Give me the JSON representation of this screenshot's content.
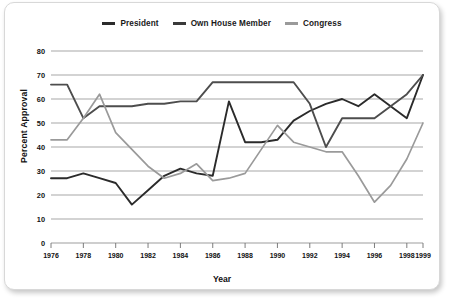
{
  "chart_data": {
    "type": "line",
    "title": "",
    "xlabel": "Year",
    "ylabel": "Percent Approval",
    "xlim": [
      1976,
      1999
    ],
    "ylim": [
      0,
      80
    ],
    "yticks": [
      0,
      10,
      20,
      30,
      40,
      50,
      60,
      70,
      80
    ],
    "xticks": [
      1976,
      1978,
      1980,
      1982,
      1984,
      1986,
      1988,
      1990,
      1992,
      1994,
      1996,
      1998,
      1999
    ],
    "grid": true,
    "legend_position": "top-center",
    "x": [
      1976,
      1977,
      1978,
      1979,
      1980,
      1981,
      1982,
      1983,
      1984,
      1985,
      1986,
      1987,
      1988,
      1989,
      1990,
      1991,
      1992,
      1993,
      1994,
      1995,
      1996,
      1997,
      1998,
      1999
    ],
    "series": [
      {
        "name": "President",
        "color": "#2b2b2b",
        "values": [
          27,
          27,
          29,
          27,
          25,
          16,
          22,
          28,
          31,
          29,
          28,
          59,
          42,
          42,
          43,
          51,
          55,
          58,
          60,
          57,
          62,
          57,
          52,
          70
        ]
      },
      {
        "name": "Own House Member",
        "color": "#4d4d4d",
        "values": [
          66,
          66,
          52,
          57,
          57,
          57,
          58,
          58,
          59,
          59,
          67,
          67,
          67,
          67,
          67,
          67,
          58,
          40,
          52,
          52,
          52,
          57,
          62,
          70
        ]
      },
      {
        "name": "Congress",
        "color": "#9a9a9a",
        "values": [
          43,
          43,
          52,
          62,
          46,
          39,
          32,
          27,
          29,
          33,
          26,
          27,
          29,
          39,
          49,
          42,
          40,
          38,
          38,
          28,
          17,
          24,
          35,
          50
        ]
      }
    ]
  },
  "legend": {
    "items": [
      {
        "label": "President",
        "color": "#2b2b2b",
        "swatch": "line-swatch"
      },
      {
        "label": "Own House Member",
        "color": "#3a3a3a",
        "swatch": "line-swatch"
      },
      {
        "label": "Congress",
        "color": "#9a9a9a",
        "swatch": "line-swatch"
      }
    ]
  },
  "axes": {
    "y_title": "Percent Approval",
    "x_title": "Year"
  },
  "colors": {
    "president": "#2b2b2b",
    "own_house_member": "#3f3f3f",
    "congress": "#9a9a9a",
    "grid": "#9d9d9d",
    "axis": "#6f6f6f",
    "text": "#111111",
    "card_bg": "#ffffff"
  }
}
